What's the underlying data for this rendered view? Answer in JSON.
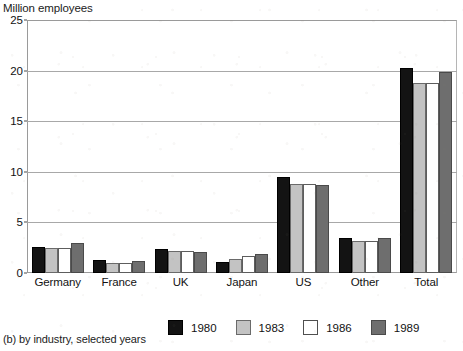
{
  "chart_data": {
    "type": "bar",
    "title": "",
    "ylabel": "Million employees",
    "xlabel": "",
    "ylim": [
      0,
      25
    ],
    "yticks": [
      0,
      5,
      10,
      15,
      20,
      25
    ],
    "grid": "horizontal",
    "legend_position": "bottom",
    "categories": [
      "Germany",
      "France",
      "UK",
      "Japan",
      "US",
      "Other",
      "Total"
    ],
    "series": [
      {
        "name": "1980",
        "color": "#131313",
        "values": [
          2.6,
          1.3,
          2.4,
          1.1,
          9.5,
          3.5,
          20.3
        ]
      },
      {
        "name": "1983",
        "color": "#c3c3c3",
        "values": [
          2.5,
          1.0,
          2.2,
          1.4,
          8.8,
          3.2,
          18.8
        ]
      },
      {
        "name": "1986",
        "color": "#ffffff",
        "values": [
          2.5,
          1.0,
          2.2,
          1.7,
          8.8,
          3.2,
          18.8
        ]
      },
      {
        "name": "1989",
        "color": "#6e6e6e",
        "values": [
          3.0,
          1.2,
          2.1,
          1.9,
          8.7,
          3.5,
          19.9
        ]
      }
    ]
  },
  "caption": "(b) by industry, selected years"
}
